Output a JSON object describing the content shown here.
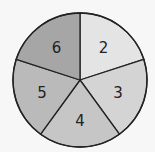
{
  "spinner": {
    "type": "pie",
    "sectors": [
      {
        "label": "2",
        "color": "#e4e4e4"
      },
      {
        "label": "3",
        "color": "#d4d4d4"
      },
      {
        "label": "4",
        "color": "#c6c6c6"
      },
      {
        "label": "5",
        "color": "#bababa"
      },
      {
        "label": "6",
        "color": "#a6a6a6"
      }
    ]
  },
  "chart_data": {
    "type": "pie",
    "categories": [
      "2",
      "3",
      "4",
      "5",
      "6"
    ],
    "values": [
      1,
      1,
      1,
      1,
      1
    ],
    "title": "",
    "note": "Five equal sectors labeled 2, 3, 4, 5, 6 (clockwise from top-right)"
  }
}
